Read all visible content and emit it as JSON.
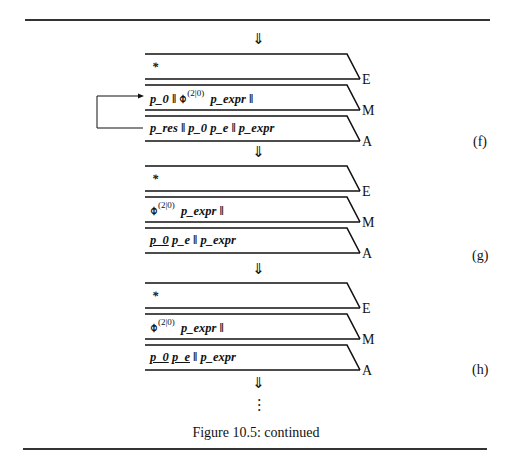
{
  "figure": {
    "caption": "Figure 10.5: continued",
    "down_arrow": "⇓",
    "vdots": "⋮",
    "lane_labels": [
      "E",
      "M",
      "A"
    ],
    "star": "*",
    "operator_symbol": "⌽",
    "operator_superscript": "(2|0)",
    "steps": [
      {
        "label": "(f)",
        "E": "*",
        "M_prefix": "p_0 ‖",
        "M_suffix": "p_expr ‖",
        "A": "p_res ‖ p_0 p_e ‖ p_expr",
        "feedback_arrow": "A → M"
      },
      {
        "label": "(g)",
        "E": "*",
        "M_suffix": "p_expr ‖",
        "A_underlined": "p_0",
        "A_rest": "p_e ‖ p_expr"
      },
      {
        "label": "(h)",
        "E": "*",
        "M_suffix": "p_expr ‖",
        "A_underlined_1": "p_0",
        "A_underlined_2": "p_e",
        "A_rest": "‖ p_expr"
      }
    ]
  }
}
